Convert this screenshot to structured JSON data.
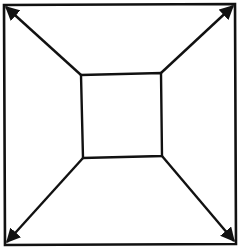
{
  "diagram": {
    "stroke_color": "#111111",
    "background": "#ffffff",
    "outer_square": {
      "top_left": [
        4,
        5
      ],
      "top_right": [
        235,
        4
      ],
      "bottom_right": [
        236,
        244
      ],
      "bottom_left": [
        5,
        245
      ]
    },
    "inner_square": {
      "top_left": [
        81,
        75
      ],
      "top_right": [
        161,
        73
      ],
      "bottom_right": [
        162,
        156
      ],
      "bottom_left": [
        83,
        158
      ]
    },
    "arrows": [
      {
        "name": "top-left",
        "from": [
          81,
          75
        ],
        "to": [
          6,
          7
        ]
      },
      {
        "name": "top-right",
        "from": [
          161,
          73
        ],
        "to": [
          233,
          6
        ]
      },
      {
        "name": "bottom-right",
        "from": [
          162,
          156
        ],
        "to": [
          234,
          241
        ]
      },
      {
        "name": "bottom-left",
        "from": [
          83,
          158
        ],
        "to": [
          7,
          242
        ]
      }
    ]
  }
}
